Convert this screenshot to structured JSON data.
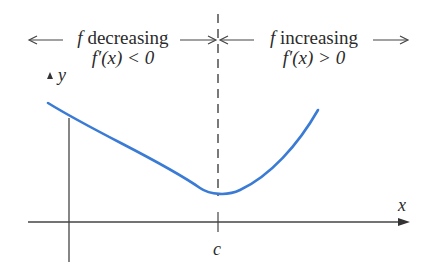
{
  "diagram": {
    "left_region": {
      "line1_fn": "f",
      "line1_text": "decreasing",
      "line2": "f′(x) < 0"
    },
    "right_region": {
      "line1_fn": "f",
      "line1_text": "increasing",
      "line2": "f′(x) > 0"
    },
    "axes": {
      "x_label": "x",
      "y_label": "y",
      "tick_label": "c"
    },
    "colors": {
      "curve": "#3a7bd5",
      "axes": "#333333",
      "text": "#2b2b2b"
    },
    "curve": {
      "description": "Function decreasing to a minimum at x = c, then increasing",
      "minimum_at": "c"
    }
  }
}
